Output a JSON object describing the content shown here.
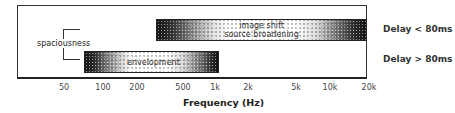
{
  "diagram": {
    "x_axis": {
      "label": "Frequency (Hz)",
      "scale": "log",
      "ticks": [
        {
          "label": "50",
          "x": 64
        },
        {
          "label": "100",
          "x": 103
        },
        {
          "label": "200",
          "x": 137
        },
        {
          "label": "500",
          "x": 183
        },
        {
          "label": "1k",
          "x": 215
        },
        {
          "label": "2k",
          "x": 248
        },
        {
          "label": "5k",
          "x": 296
        },
        {
          "label": "10k",
          "x": 330
        },
        {
          "label": "20k",
          "x": 369
        }
      ]
    },
    "bands": [
      {
        "id": "upper",
        "lines": [
          "image shift",
          "source broadening"
        ],
        "range_hz": [
          300,
          20000
        ],
        "condition": "Delay < 80ms"
      },
      {
        "id": "lower",
        "lines": [
          "envelopment"
        ],
        "range_hz": [
          80,
          1000
        ],
        "condition": "Delay > 80ms"
      }
    ],
    "bracket_label": "spaciousness",
    "conditions": [
      "Delay < 80ms",
      "Delay > 80ms"
    ]
  }
}
